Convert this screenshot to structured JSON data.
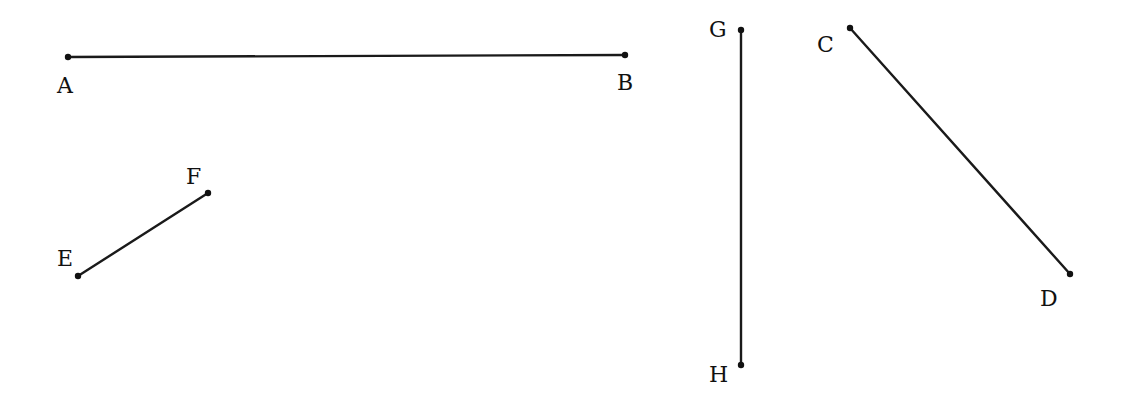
{
  "diagram": {
    "background": "#ffffff",
    "stroke_color": "#1a1a1a",
    "segments": [
      {
        "name": "AB",
        "p1": {
          "label": "A",
          "x": 68,
          "y": 57,
          "lx": 57,
          "ly": 93
        },
        "p2": {
          "label": "B",
          "x": 625,
          "y": 55,
          "lx": 617,
          "ly": 90
        }
      },
      {
        "name": "EF",
        "p1": {
          "label": "E",
          "x": 78,
          "y": 276,
          "lx": 57,
          "ly": 266
        },
        "p2": {
          "label": "F",
          "x": 208,
          "y": 193,
          "lx": 186,
          "ly": 184
        }
      },
      {
        "name": "GH",
        "p1": {
          "label": "G",
          "x": 741,
          "y": 30,
          "lx": 709,
          "ly": 37
        },
        "p2": {
          "label": "H",
          "x": 741,
          "y": 365,
          "lx": 709,
          "ly": 382
        }
      },
      {
        "name": "CD",
        "p1": {
          "label": "C",
          "x": 850,
          "y": 28,
          "lx": 817,
          "ly": 52
        },
        "p2": {
          "label": "D",
          "x": 1070,
          "y": 274,
          "lx": 1040,
          "ly": 306
        }
      }
    ]
  }
}
